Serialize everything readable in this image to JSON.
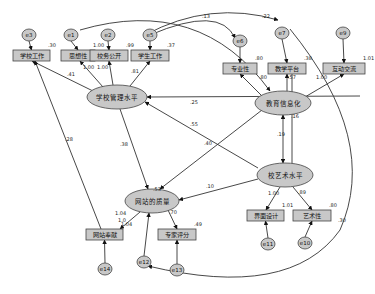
{
  "diagram": {
    "type": "structural-equation-model",
    "latent": [
      {
        "id": "L1",
        "label": "学校管理水平",
        "cx": 117,
        "cy": 97,
        "rx": 30,
        "ry": 12
      },
      {
        "id": "L2",
        "label": "教育信息化",
        "cx": 283,
        "cy": 103,
        "rx": 28,
        "ry": 12
      },
      {
        "id": "L3",
        "label": "校艺术水平",
        "cx": 285,
        "cy": 175,
        "rx": 28,
        "ry": 12
      },
      {
        "id": "L4",
        "label": "网站的质量",
        "cx": 152,
        "cy": 201,
        "rx": 27,
        "ry": 12
      }
    ],
    "observed": [
      {
        "id": "O1",
        "label": "学校工作",
        "x": 13,
        "y": 50,
        "w": 37,
        "h": 11,
        "r2": ".30"
      },
      {
        "id": "O2",
        "label": "思想性",
        "x": 61,
        "y": 50,
        "w": 34,
        "h": 11,
        "r2": "1.00"
      },
      {
        "id": "O3",
        "label": "校务公开",
        "x": 90,
        "y": 50,
        "w": 38,
        "h": 11,
        "r2": ".99"
      },
      {
        "id": "O4",
        "label": "学生工作",
        "x": 131,
        "y": 50,
        "w": 38,
        "h": 11,
        "r2": ".37"
      },
      {
        "id": "O5",
        "label": "专业性",
        "x": 223,
        "y": 63,
        "w": 34,
        "h": 11,
        "r2": ".80"
      },
      {
        "id": "O6",
        "label": "教学平台",
        "x": 268,
        "y": 63,
        "w": 38,
        "h": 11,
        "r2": ".38"
      },
      {
        "id": "O7",
        "label": "互动交流",
        "x": 323,
        "y": 63,
        "w": 42,
        "h": 11,
        "r2": "1.01"
      },
      {
        "id": "O8",
        "label": "界面设计",
        "x": 247,
        "y": 210,
        "w": 37,
        "h": 11,
        "r2": "1.01"
      },
      {
        "id": "O9",
        "label": "艺术性",
        "x": 293,
        "y": 210,
        "w": 38,
        "h": 11,
        "r2": ".80"
      },
      {
        "id": "O10",
        "label": "网站奉献",
        "x": 86,
        "y": 229,
        "w": 37,
        "h": 11,
        "r2": "1.04"
      },
      {
        "id": "O11",
        "label": "专家评分",
        "x": 158,
        "y": 229,
        "w": 38,
        "h": 11,
        "r2": ".49"
      }
    ],
    "errors": [
      {
        "id": "e3",
        "label": "e3",
        "cx": 29,
        "cy": 35
      },
      {
        "id": "e1",
        "label": "e1",
        "cx": 71,
        "cy": 35
      },
      {
        "id": "e2",
        "label": "e2",
        "cx": 108,
        "cy": 35
      },
      {
        "id": "e5",
        "label": "e5",
        "cx": 150,
        "cy": 35
      },
      {
        "id": "e6",
        "label": "e6",
        "cx": 240,
        "cy": 41
      },
      {
        "id": "e7",
        "label": "e7",
        "cx": 282,
        "cy": 33
      },
      {
        "id": "e9",
        "label": "e9",
        "cx": 343,
        "cy": 33
      },
      {
        "id": "e11",
        "label": "e11",
        "cx": 268,
        "cy": 244
      },
      {
        "id": "e10",
        "label": "e10",
        "cx": 305,
        "cy": 243
      },
      {
        "id": "e14",
        "label": "e14",
        "cx": 105,
        "cy": 269
      },
      {
        "id": "e12",
        "label": "e12",
        "cx": 144,
        "cy": 262
      },
      {
        "id": "e13",
        "label": "e13",
        "cx": 177,
        "cy": 270
      }
    ],
    "path_labels": [
      {
        "text": ".41",
        "x": 67,
        "y": 76
      },
      {
        "text": "1.00",
        "x": 83,
        "y": 69
      },
      {
        "text": "1.00",
        "x": 97,
        "y": 69
      },
      {
        "text": ".81",
        "x": 131,
        "y": 73
      },
      {
        "text": ".13",
        "x": 202,
        "y": 18
      },
      {
        "text": ".22",
        "x": 262,
        "y": 18
      },
      {
        "text": ".80",
        "x": 259,
        "y": 79
      },
      {
        "text": ".57",
        "x": 288,
        "y": 79
      },
      {
        "text": "1.00",
        "x": 316,
        "y": 79
      },
      {
        "text": ".25",
        "x": 190,
        "y": 104
      },
      {
        "text": ".16",
        "x": 291,
        "y": 118
      },
      {
        "text": ".19",
        "x": 277,
        "y": 136
      },
      {
        "text": ".55",
        "x": 190,
        "y": 126
      },
      {
        "text": ".40",
        "x": 204,
        "y": 145
      },
      {
        "text": ".28",
        "x": 65,
        "y": 141
      },
      {
        "text": ".38",
        "x": 120,
        "y": 146
      },
      {
        "text": ".53",
        "x": 153,
        "y": 191
      },
      {
        "text": ".10",
        "x": 206,
        "y": 188
      },
      {
        "text": "1.00",
        "x": 268,
        "y": 195
      },
      {
        "text": ".89",
        "x": 298,
        "y": 194
      },
      {
        "text": "1.04",
        "x": 115,
        "y": 215
      },
      {
        "text": "1.0",
        "x": 118,
        "y": 222
      },
      {
        "text": ".70",
        "x": 169,
        "y": 214
      },
      {
        "text": ".30",
        "x": 338,
        "y": 222
      }
    ]
  }
}
